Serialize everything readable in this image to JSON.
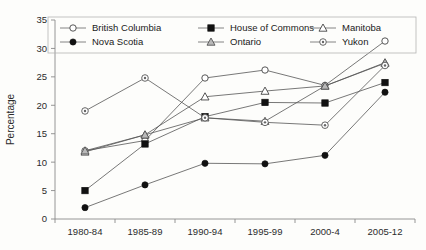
{
  "chart_data": {
    "type": "line",
    "title": "",
    "xlabel": "",
    "ylabel": "Percentage",
    "categories": [
      "1980-84",
      "1985-89",
      "1990-94",
      "1995-99",
      "2000-4",
      "2005-12"
    ],
    "ylim": [
      0,
      35
    ],
    "ytick_step": 5,
    "yticks": [
      "0",
      "5",
      "10",
      "15",
      "20",
      "25",
      "30",
      "35"
    ],
    "grid": false,
    "legend_position": "top-inside",
    "series": [
      {
        "name": "British Columbia",
        "marker": "open-circle",
        "values": [
          12.0,
          13.8,
          24.8,
          26.2,
          23.5,
          31.3
        ]
      },
      {
        "name": "House of Commons",
        "marker": "filled-square",
        "values": [
          5.0,
          13.2,
          18.0,
          20.5,
          20.4,
          24.0
        ]
      },
      {
        "name": "Manitoba",
        "marker": "open-triangle",
        "values": [
          11.8,
          14.8,
          21.5,
          22.5,
          23.4,
          27.4
        ]
      },
      {
        "name": "Nova Scotia",
        "marker": "filled-circle",
        "values": [
          2.0,
          6.0,
          9.8,
          9.7,
          11.2,
          22.3
        ]
      },
      {
        "name": "Ontario",
        "marker": "shaded-triangle",
        "values": [
          12.0,
          14.8,
          17.8,
          17.2,
          23.4,
          27.5
        ]
      },
      {
        "name": "Yukon",
        "marker": "dot-circle",
        "values": [
          19.0,
          24.8,
          17.8,
          17.0,
          16.5,
          27.0
        ]
      }
    ]
  },
  "legend": {
    "entries": [
      {
        "label": "British Columbia",
        "marker": "open-circle"
      },
      {
        "label": "House of Commons",
        "marker": "filled-square"
      },
      {
        "label": "Manitoba",
        "marker": "open-triangle"
      },
      {
        "label": "Nova Scotia",
        "marker": "filled-circle"
      },
      {
        "label": "Ontario",
        "marker": "shaded-triangle"
      },
      {
        "label": "Yukon",
        "marker": "dot-circle"
      }
    ]
  },
  "colors": {
    "line": "#555555",
    "axis": "#8a8a8a",
    "text": "#1a1a1a",
    "background": "#fdfdfb",
    "marker_fill_open": "#ffffff",
    "marker_fill_solid": "#111111",
    "marker_fill_shaded": "#b9b9b9"
  }
}
